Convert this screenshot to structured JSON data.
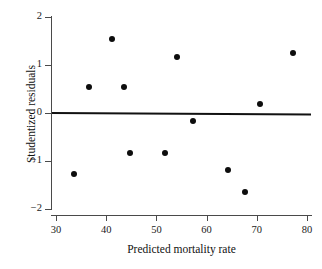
{
  "chart_data": {
    "type": "scatter",
    "title": "",
    "xlabel": "Predicted mortality rate",
    "ylabel": "Studentized residuals",
    "xlim": [
      29,
      81
    ],
    "ylim": [
      -2.15,
      2.15
    ],
    "xticks": [
      30,
      40,
      50,
      60,
      70,
      80
    ],
    "yticks": [
      2,
      1,
      0,
      -1,
      -2
    ],
    "xtick_labels": [
      "30",
      "40",
      "50",
      "60",
      "70",
      "80"
    ],
    "ytick_labels": [
      "2",
      "1",
      "0",
      "−1",
      "−2"
    ],
    "grid": false,
    "legend": null,
    "reference_line": {
      "orientation": "horizontal",
      "y": 0,
      "color": "#111111"
    },
    "marker": {
      "shape": "circle",
      "color": "#0d0d0d",
      "size": 6
    },
    "x": [
      33.5,
      36.6,
      41.1,
      43.6,
      44.8,
      51.8,
      54.1,
      57.2,
      64.2,
      67.7,
      70.7,
      77.3
    ],
    "y": [
      -1.27,
      0.54,
      1.54,
      0.54,
      -0.83,
      -0.83,
      1.17,
      -0.17,
      -1.19,
      -1.65,
      0.19,
      1.25
    ],
    "points": [
      {
        "x": 33.5,
        "y": -1.27
      },
      {
        "x": 36.6,
        "y": 0.54
      },
      {
        "x": 41.1,
        "y": 1.54
      },
      {
        "x": 43.6,
        "y": 0.54
      },
      {
        "x": 44.8,
        "y": -0.83
      },
      {
        "x": 51.8,
        "y": -0.83
      },
      {
        "x": 54.1,
        "y": 1.17
      },
      {
        "x": 57.2,
        "y": -0.17
      },
      {
        "x": 64.2,
        "y": -1.19
      },
      {
        "x": 67.7,
        "y": -1.65
      },
      {
        "x": 70.7,
        "y": 0.19
      },
      {
        "x": 77.3,
        "y": 1.25
      }
    ]
  },
  "colors": {
    "axis": "#4a4a4a",
    "marker": "#0d0d0d",
    "reference_line": "#111111",
    "text": "#111111",
    "background": "#ffffff"
  }
}
